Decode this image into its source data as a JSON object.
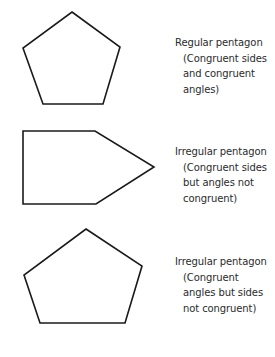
{
  "figure": {
    "stroke_color": "#1a1a1a",
    "fill_color": "#ffffff",
    "items": [
      {
        "title": "Regular pentagon",
        "description": "(Congruent sides\nand congruent\nangles)",
        "points": "72,12 120,47 103,104 43,104 23,48"
      },
      {
        "title": "Irregular pentagon",
        "description": "(Congruent sides\nbut angles not\ncongruent)",
        "points": "23,131 95,131 154,167 96,204 23,204"
      },
      {
        "title": "Irregular pentagon",
        "description": "(Congruent\nangles but sides\nnot congruent)",
        "points": "86,229 142,266 125,323 40,323 24,275"
      }
    ]
  }
}
